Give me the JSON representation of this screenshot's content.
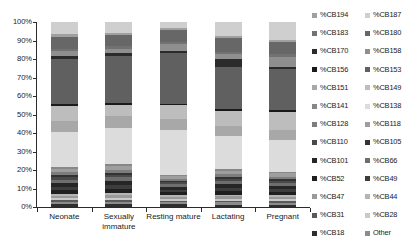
{
  "chart_data": {
    "type": "bar",
    "subtype": "stacked-100-percent",
    "title": "",
    "xlabel": "",
    "ylabel": "",
    "ylim": [
      0,
      100
    ],
    "ytick_labels": [
      "100%",
      "90%",
      "80%",
      "70%",
      "60%",
      "50%",
      "40%",
      "30%",
      "20%",
      "10%",
      "0%"
    ],
    "ytick_values": [
      100,
      90,
      80,
      70,
      60,
      50,
      40,
      30,
      20,
      10,
      0
    ],
    "grid": false,
    "legend_position": "right",
    "categories": [
      "Neonate",
      "Sexually immature",
      "Resting mature",
      "Lactating",
      "Pregnant"
    ],
    "series": [
      {
        "name": "%CB18",
        "color": "#2e2e2e",
        "values": [
          1.5,
          1.6,
          1.4,
          1.3,
          1.2
        ]
      },
      {
        "name": "Other",
        "color": "#8c8c8c",
        "values": [
          1.2,
          1.3,
          1.1,
          1.2,
          1.1
        ]
      },
      {
        "name": "%CB31",
        "color": "#5a5a5a",
        "values": [
          0.9,
          1.0,
          0.8,
          0.9,
          0.8
        ]
      },
      {
        "name": "%CB28",
        "color": "#c9c9c9",
        "values": [
          1.1,
          1.2,
          1.0,
          1.1,
          1.0
        ]
      },
      {
        "name": "%CB47",
        "color": "#9a9a9a",
        "values": [
          1.3,
          1.4,
          1.2,
          1.3,
          1.2
        ]
      },
      {
        "name": "%CB44",
        "color": "#b5b5b5",
        "values": [
          1.0,
          1.1,
          0.9,
          1.0,
          0.9
        ]
      },
      {
        "name": "%CB52",
        "color": "#1f1f1f",
        "values": [
          2.4,
          2.6,
          1.8,
          2.2,
          2.0
        ]
      },
      {
        "name": "%CB49",
        "color": "#3d3d3d",
        "values": [
          1.6,
          1.8,
          1.2,
          1.5,
          1.3
        ]
      },
      {
        "name": "%CB101",
        "color": "#262626",
        "values": [
          2.2,
          2.4,
          1.6,
          2.0,
          1.9
        ]
      },
      {
        "name": "%CB66",
        "color": "#6e6e6e",
        "values": [
          1.8,
          1.9,
          1.3,
          1.6,
          1.5
        ]
      },
      {
        "name": "%CB110",
        "color": "#4a4a4a",
        "values": [
          1.4,
          1.5,
          1.0,
          1.3,
          1.2
        ]
      },
      {
        "name": "%CB105",
        "color": "#333333",
        "values": [
          1.1,
          1.2,
          0.8,
          1.0,
          0.9
        ]
      },
      {
        "name": "%CB128",
        "color": "#7d7d7d",
        "values": [
          1.5,
          1.6,
          1.1,
          1.4,
          1.3
        ]
      },
      {
        "name": "%CB118",
        "color": "#9e9e9e",
        "values": [
          2.0,
          2.1,
          1.5,
          1.8,
          1.7
        ]
      },
      {
        "name": "%CB141",
        "color": "#878787",
        "values": [
          1.0,
          1.1,
          0.8,
          1.0,
          0.9
        ]
      },
      {
        "name": "%CB138",
        "color": "#dcdcdc",
        "values": [
          19.0,
          20.0,
          24.0,
          18.0,
          17.0
        ]
      },
      {
        "name": "%CB151",
        "color": "#a8a8a8",
        "values": [
          6.0,
          6.5,
          6.0,
          5.5,
          5.5
        ]
      },
      {
        "name": "%CB149",
        "color": "#bdbdbd",
        "values": [
          8.0,
          6.0,
          7.5,
          8.5,
          9.5
        ]
      },
      {
        "name": "%CB156",
        "color": "#1a1a1a",
        "values": [
          1.0,
          1.1,
          0.9,
          1.0,
          0.9
        ]
      },
      {
        "name": "%CB153",
        "color": "#606060",
        "values": [
          25.0,
          26.0,
          27.5,
          23.0,
          22.0
        ]
      },
      {
        "name": "%CB170",
        "color": "#2b2b2b",
        "values": [
          1.2,
          1.3,
          1.1,
          4.0,
          1.2
        ]
      },
      {
        "name": "%CB158",
        "color": "#8f8f8f",
        "values": [
          3.0,
          2.5,
          3.5,
          3.0,
          5.5
        ]
      },
      {
        "name": "%CB183",
        "color": "#727272",
        "values": [
          1.3,
          1.4,
          1.2,
          1.3,
          1.3
        ]
      },
      {
        "name": "%CB180",
        "color": "#676767",
        "values": [
          6.5,
          6.0,
          6.5,
          7.5,
          6.5
        ]
      },
      {
        "name": "%CB194",
        "color": "#a0a0a0",
        "values": [
          1.2,
          1.3,
          1.1,
          1.2,
          1.1
        ]
      },
      {
        "name": "%CB187",
        "color": "#cfcfcf",
        "values": [
          6.8,
          6.1,
          3.2,
          7.4,
          9.6
        ]
      }
    ]
  },
  "axis": {
    "y_ticks": [
      {
        "label": "100%",
        "value": 100
      },
      {
        "label": "90%",
        "value": 90
      },
      {
        "label": "80%",
        "value": 80
      },
      {
        "label": "70%",
        "value": 70
      },
      {
        "label": "60%",
        "value": 60
      },
      {
        "label": "50%",
        "value": 50
      },
      {
        "label": "40%",
        "value": 40
      },
      {
        "label": "30%",
        "value": 30
      },
      {
        "label": "20%",
        "value": 20
      },
      {
        "label": "10%",
        "value": 10
      },
      {
        "label": "0%",
        "value": 0
      }
    ],
    "x_categories": [
      {
        "label": "Neonate"
      },
      {
        "label": "Sexually immature"
      },
      {
        "label": "Resting mature"
      },
      {
        "label": "Lactating"
      },
      {
        "label": "Pregnant"
      }
    ]
  },
  "legend": {
    "columns": [
      {
        "items": [
          {
            "label": "%CB194",
            "color": "#a0a0a0"
          },
          {
            "label": "%CB183",
            "color": "#727272"
          },
          {
            "label": "%CB170",
            "color": "#2b2b2b"
          },
          {
            "label": "%CB156",
            "color": "#1a1a1a"
          },
          {
            "label": "%CB151",
            "color": "#a8a8a8"
          },
          {
            "label": "%CB141",
            "color": "#878787"
          },
          {
            "label": "%CB128",
            "color": "#7d7d7d"
          },
          {
            "label": "%CB110",
            "color": "#4a4a4a"
          },
          {
            "label": "%CB101",
            "color": "#262626"
          },
          {
            "label": "%CB52",
            "color": "#1f1f1f"
          },
          {
            "label": "%CB47",
            "color": "#9a9a9a"
          },
          {
            "label": "%CB31",
            "color": "#5a5a5a"
          },
          {
            "label": "%CB18",
            "color": "#2e2e2e"
          }
        ]
      },
      {
        "items": [
          {
            "label": "%CB187",
            "color": "#cfcfcf"
          },
          {
            "label": "%CB180",
            "color": "#676767"
          },
          {
            "label": "%CB158",
            "color": "#8f8f8f"
          },
          {
            "label": "%CB153",
            "color": "#606060"
          },
          {
            "label": "%CB149",
            "color": "#bdbdbd"
          },
          {
            "label": "%CB138",
            "color": "#dcdcdc"
          },
          {
            "label": "%CB118",
            "color": "#9e9e9e"
          },
          {
            "label": "%CB105",
            "color": "#333333"
          },
          {
            "label": "%CB66",
            "color": "#6e6e6e"
          },
          {
            "label": "%CB49",
            "color": "#3d3d3d"
          },
          {
            "label": "%CB44",
            "color": "#b5b5b5"
          },
          {
            "label": "%CB28",
            "color": "#c9c9c9"
          },
          {
            "label": "Other",
            "color": "#8c8c8c"
          }
        ]
      }
    ]
  }
}
